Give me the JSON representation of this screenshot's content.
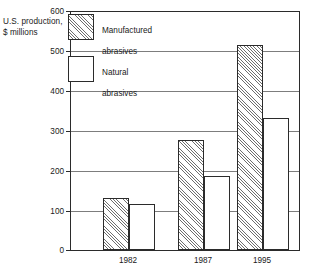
{
  "chart_data": {
    "type": "bar",
    "title": "",
    "subtitle": "",
    "xlabel": "",
    "ylabel": "U.S. production,\n$ millions",
    "ylabel_lines": [
      "U.S. production,",
      "$ millions"
    ],
    "categories": [
      "1982",
      "1987",
      "1995"
    ],
    "series": [
      {
        "name": "Manufactured abrasives",
        "values": [
          130,
          278,
          517
        ]
      },
      {
        "name": "Natural abrasives",
        "values": [
          117,
          187,
          333
        ]
      }
    ],
    "ylim": [
      0,
      600
    ],
    "yticks": [
      0,
      100,
      200,
      300,
      400,
      500,
      600
    ],
    "ytick_labels": [
      "0",
      "100",
      "200",
      "300",
      "400",
      "500",
      "600"
    ],
    "grid": true,
    "grid_axis": "y",
    "legend_position": "upper-left-inside",
    "legend": [
      {
        "label": "Manufactured\nabrasives",
        "label_lines": [
          "Manufactured",
          "abrasives"
        ],
        "fill": "hatched"
      },
      {
        "label": "Natural\nabrasives",
        "label_lines": [
          "Natural",
          "abrasives"
        ],
        "fill": "white"
      }
    ],
    "colors": {
      "axis": "#2b2b2b",
      "gridline": "#7d7d7d",
      "hatch": "#6e6e6e",
      "bar_fill": "#ffffff",
      "text": "#1a1a1a",
      "background": "#ffffff"
    }
  }
}
